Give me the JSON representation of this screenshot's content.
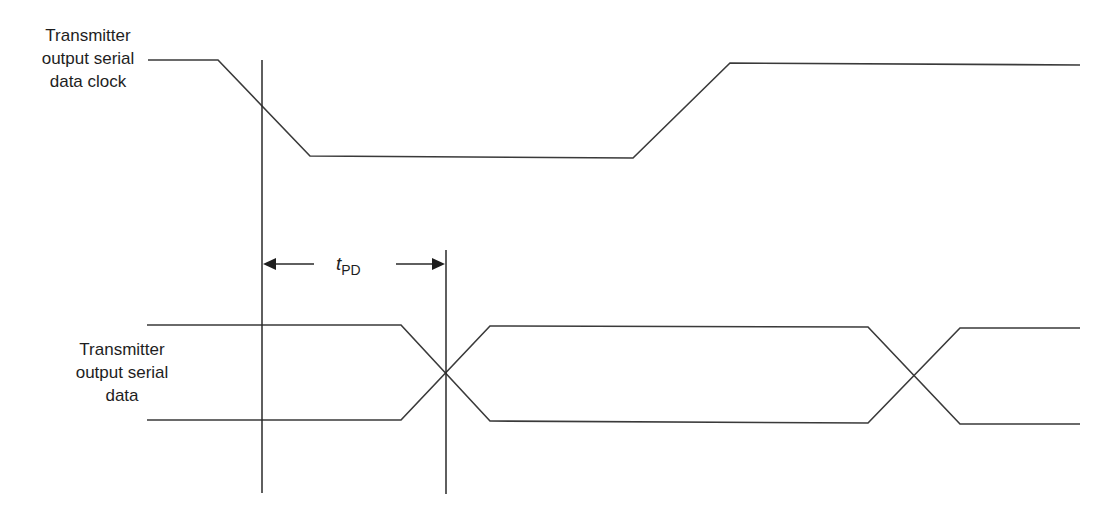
{
  "diagram": {
    "type": "timing-diagram",
    "signals": [
      {
        "name": "clock",
        "label_lines": [
          "Transmitter",
          "output serial",
          "data clock"
        ],
        "waveform": "high -> falling edge -> low -> rising edge -> high"
      },
      {
        "name": "data",
        "label_lines": [
          "Transmitter",
          "output serial",
          "data"
        ],
        "waveform": "bus with two transitions (crossovers)"
      }
    ],
    "timing_parameter": {
      "symbol": "t",
      "subscript": "PD",
      "description": "propagation delay from clock falling edge midpoint to data crossover"
    },
    "colors": {
      "line": "#3a3a3a",
      "background": "#ffffff",
      "text": "#1e1e1e"
    }
  }
}
